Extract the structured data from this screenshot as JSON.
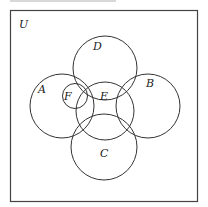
{
  "diagram": {
    "type": "venn",
    "universe_label": "U",
    "sets": [
      {
        "name": "A",
        "label": "A"
      },
      {
        "name": "B",
        "label": "B"
      },
      {
        "name": "C",
        "label": "C"
      },
      {
        "name": "D",
        "label": "D"
      },
      {
        "name": "E",
        "label": "E"
      },
      {
        "name": "F",
        "label": "F"
      }
    ],
    "stroke_color": "#333333"
  }
}
